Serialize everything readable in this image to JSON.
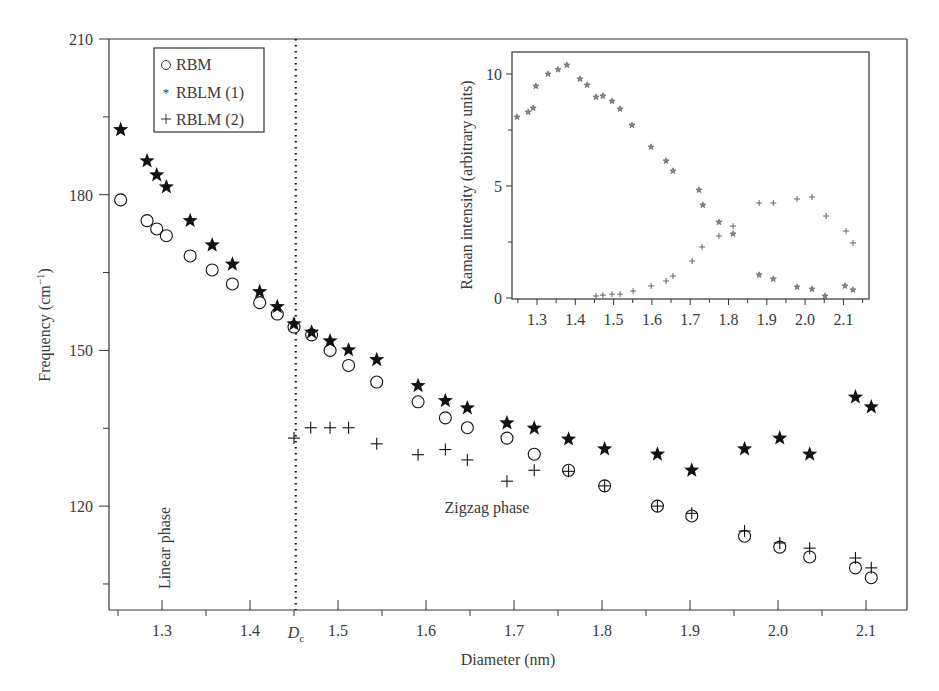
{
  "chart_data": [
    {
      "id": "main",
      "type": "scatter",
      "title": "",
      "xlabel": "Diameter (nm)",
      "ylabel": "Frequency (cm⁻¹)",
      "xlim": [
        1.24,
        2.147
      ],
      "ylim": [
        100,
        210
      ],
      "x_ticks": [
        1.3,
        1.4,
        1.5,
        1.6,
        1.7,
        1.8,
        1.9,
        2.0,
        2.1
      ],
      "x_tick_labels": [
        "1.3",
        "1.4",
        "1.5",
        "1.6",
        "1.7",
        "1.8",
        "1.9",
        "2.0",
        "2.1"
      ],
      "x_minor_ticks": [
        1.25,
        1.35,
        1.45,
        1.55,
        1.65,
        1.75,
        1.85,
        1.95,
        2.05
      ],
      "y_ticks": [
        120,
        150,
        180,
        210
      ],
      "y_tick_labels": [
        "120",
        "150",
        "180",
        "210"
      ],
      "y_minor_ticks": [
        105,
        135,
        165,
        195
      ],
      "grid": false,
      "legend": {
        "position": "upper left",
        "entries": [
          {
            "marker": "circle-open",
            "label": "RBM"
          },
          {
            "marker": "star",
            "label": "RBLM (1)"
          },
          {
            "marker": "plus",
            "label": "RBLM (2)"
          }
        ]
      },
      "annotations": [
        {
          "type": "vline",
          "x": 1.452,
          "style": "dotted",
          "label": "D",
          "subscript": "c"
        },
        {
          "type": "text",
          "text": "Linear phase",
          "x": 1.275,
          "y": 113,
          "rotation": -90
        },
        {
          "type": "text",
          "text": "Zigzag phase",
          "x": 1.76,
          "y": 120
        }
      ],
      "series": [
        {
          "name": "RBM",
          "marker": "circle-open",
          "x": [
            1.253,
            1.283,
            1.294,
            1.305,
            1.332,
            1.357,
            1.38,
            1.411,
            1.431,
            1.45,
            1.47,
            1.491,
            1.512,
            1.544,
            1.591,
            1.622,
            1.647,
            1.692,
            1.723,
            1.762,
            1.803,
            1.863,
            1.902,
            1.962,
            2.002,
            2.036,
            2.088,
            2.106
          ],
          "y": [
            179.0,
            175.0,
            173.4,
            172.1,
            168.2,
            165.5,
            162.8,
            159.2,
            157.0,
            154.5,
            153.0,
            150.0,
            147.1,
            143.9,
            140.1,
            137.0,
            135.1,
            133.1,
            130.0,
            126.9,
            123.9,
            120.0,
            118.1,
            114.2,
            112.1,
            110.2,
            108.1,
            106.2
          ]
        },
        {
          "name": "RBLM (1)",
          "marker": "star",
          "x": [
            1.253,
            1.283,
            1.294,
            1.305,
            1.332,
            1.357,
            1.38,
            1.411,
            1.431,
            1.45,
            1.47,
            1.491,
            1.512,
            1.544,
            1.591,
            1.622,
            1.647,
            1.692,
            1.723,
            1.762,
            1.803,
            1.863,
            1.902,
            1.962,
            2.002,
            2.036,
            2.088,
            2.106
          ],
          "y": [
            192.5,
            186.5,
            183.8,
            181.5,
            175.0,
            170.3,
            166.6,
            161.3,
            158.4,
            155.1,
            153.5,
            151.8,
            150.1,
            148.2,
            143.2,
            140.3,
            138.9,
            136.0,
            135.0,
            132.9,
            131.0,
            130.0,
            126.9,
            131.0,
            133.1,
            130.0,
            141.0,
            139.1
          ]
        },
        {
          "name": "RBLM (2)",
          "marker": "plus",
          "x": [
            1.45,
            1.469,
            1.491,
            1.512,
            1.544,
            1.591,
            1.622,
            1.647,
            1.692,
            1.723,
            1.762,
            1.803,
            1.863,
            1.902,
            1.962,
            2.002,
            2.036,
            2.088,
            2.106
          ],
          "y": [
            133.1,
            135.1,
            135.1,
            135.1,
            132.0,
            129.9,
            130.9,
            128.9,
            124.8,
            126.9,
            126.7,
            123.9,
            120.0,
            118.6,
            115.2,
            112.9,
            111.9,
            110.0,
            108.1
          ]
        }
      ]
    },
    {
      "id": "inset",
      "type": "scatter",
      "title": "",
      "xlabel": "",
      "ylabel": "Raman intensity (arbitrary units)",
      "xlim": [
        1.235,
        2.167
      ],
      "ylim": [
        0,
        11.0
      ],
      "x_ticks": [
        1.3,
        1.4,
        1.5,
        1.6,
        1.7,
        1.8,
        1.9,
        2.0,
        2.1
      ],
      "x_tick_labels": [
        "1.3",
        "1.4",
        "1.5",
        "1.6",
        "1.7",
        "1.8",
        "1.9",
        "2.0",
        "2.1"
      ],
      "x_minor_ticks": [
        1.25,
        1.35,
        1.45,
        1.55,
        1.65,
        1.75,
        1.85,
        1.95,
        2.05,
        2.15
      ],
      "y_ticks": [
        0,
        5,
        10
      ],
      "y_tick_labels": [
        "0",
        "5",
        "10"
      ],
      "y_minor_ticks": [
        2.5,
        7.5
      ],
      "grid": false,
      "series": [
        {
          "name": "RBLM (1)",
          "marker": "star-small",
          "x": [
            1.248,
            1.277,
            1.29,
            1.297,
            1.329,
            1.355,
            1.378,
            1.412,
            1.431,
            1.454,
            1.472,
            1.496,
            1.517,
            1.548,
            1.598,
            1.637,
            1.655,
            1.723,
            1.733,
            1.775,
            1.812,
            1.88,
            1.917,
            1.979,
            2.018,
            2.052,
            2.104,
            2.125
          ],
          "y": [
            8.08,
            8.3,
            8.48,
            9.46,
            10.0,
            10.2,
            10.4,
            9.78,
            9.51,
            8.97,
            9.02,
            8.79,
            8.44,
            7.72,
            6.74,
            6.12,
            5.67,
            4.82,
            4.15,
            3.39,
            2.86,
            1.03,
            0.85,
            0.49,
            0.4,
            0.09,
            0.54,
            0.36
          ]
        },
        {
          "name": "RBLM (2)",
          "marker": "plus-small",
          "x": [
            1.454,
            1.472,
            1.496,
            1.517,
            1.551,
            1.598,
            1.637,
            1.655,
            1.705,
            1.731,
            1.775,
            1.812,
            1.88,
            1.917,
            1.979,
            2.018,
            2.055,
            2.107,
            2.125
          ],
          "y": [
            0.09,
            0.13,
            0.17,
            0.17,
            0.31,
            0.54,
            0.76,
            0.98,
            1.65,
            2.28,
            2.77,
            3.21,
            4.24,
            4.24,
            4.42,
            4.51,
            3.66,
            2.99,
            2.46
          ]
        }
      ]
    }
  ],
  "labels": {
    "xlabel": "Diameter (nm)",
    "ylabel_main": "Frequency (cm",
    "ylabel_sup": "−1",
    "ylabel_close": ")",
    "inset_ylabel": "Raman intensity (arbitrary units)",
    "dc_label": "D",
    "dc_sub": "c",
    "linear_phase": "Linear phase",
    "zigzag_phase": "Zigzag phase",
    "legend_rbm": "RBM",
    "legend_rblm1": "RBLM (1)",
    "legend_rblm2": "RBLM (2)"
  },
  "colors": {
    "axis": "#333333",
    "marker": "#111111",
    "inset_marker": "#555555",
    "text": "#3a3a3a"
  }
}
